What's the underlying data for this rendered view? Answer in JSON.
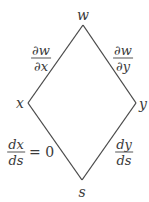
{
  "diagram": {
    "type": "tree-diagram",
    "line_color": "#4a4a4a",
    "nodes": {
      "top": {
        "label": "w",
        "x": 83,
        "y": 25
      },
      "left": {
        "label": "x",
        "x": 28,
        "y": 103
      },
      "right": {
        "label": "y",
        "x": 136,
        "y": 103
      },
      "bottom": {
        "label": "s",
        "x": 82,
        "y": 180
      }
    },
    "edges": [
      {
        "from": "top",
        "to": "left",
        "label_num": "∂w",
        "label_den": "∂x"
      },
      {
        "from": "top",
        "to": "right",
        "label_num": "∂w",
        "label_den": "∂y"
      },
      {
        "from": "left",
        "to": "bottom",
        "label_num": "dx",
        "label_den": "ds",
        "label_suffix": "= 0"
      },
      {
        "from": "right",
        "to": "bottom",
        "label_num": "dy",
        "label_den": "ds"
      }
    ]
  }
}
